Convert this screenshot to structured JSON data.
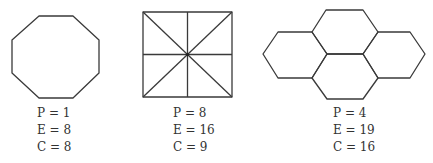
{
  "figures": [
    {
      "name": "octagon",
      "labels": {
        "p": "P = 1",
        "e": "E = 8",
        "c": "C = 8"
      }
    },
    {
      "name": "subdivided-square",
      "labels": {
        "p": "P = 8",
        "e": "E = 16",
        "c": "C = 9"
      }
    },
    {
      "name": "hexagon-cluster",
      "labels": {
        "p": "P = 4",
        "e": "E = 19",
        "c": "C = 16"
      }
    }
  ],
  "colors": {
    "stroke": "#3a3a3a",
    "text": "#333333",
    "background": "#ffffff"
  }
}
